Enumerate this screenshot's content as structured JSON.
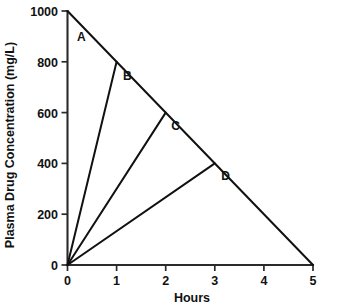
{
  "chart_data": {
    "type": "line",
    "title": "",
    "xlabel": "Hours",
    "ylabel": "Plasma Drug Concentration (mg/L)",
    "xlim": [
      0,
      5
    ],
    "ylim": [
      0,
      1000
    ],
    "x_ticks": [
      "0",
      "1",
      "2",
      "3",
      "4",
      "5"
    ],
    "x_tick_values": [
      0,
      1,
      2,
      3,
      4,
      5
    ],
    "y_ticks": [
      "0",
      "200",
      "400",
      "600",
      "800",
      "1000"
    ],
    "y_tick_values": [
      0,
      200,
      400,
      600,
      800,
      1000
    ],
    "grid": false,
    "legend": "none",
    "line_color": "#111111",
    "axis_color": "#2a2a2a",
    "series": [
      {
        "name": "elimination-line",
        "points": [
          [
            0,
            1000
          ],
          [
            5,
            0
          ]
        ]
      },
      {
        "name": "absorption-line-b",
        "points": [
          [
            0,
            0
          ],
          [
            1,
            800
          ]
        ]
      },
      {
        "name": "absorption-line-c",
        "points": [
          [
            0,
            0
          ],
          [
            2,
            600
          ]
        ]
      },
      {
        "name": "absorption-line-d",
        "points": [
          [
            0,
            0
          ],
          [
            3,
            400
          ]
        ]
      }
    ],
    "annotations": [
      {
        "text": "A",
        "x": 0.28,
        "y": 880
      },
      {
        "text": "B",
        "x": 1.22,
        "y": 728
      },
      {
        "text": "C",
        "x": 2.2,
        "y": 533
      },
      {
        "text": "D",
        "x": 3.22,
        "y": 333
      }
    ]
  },
  "labels": {
    "y_axis_title": "Plasma Drug Concentration (mg/L)",
    "x_axis_title": "Hours",
    "series_a": "A",
    "series_b": "B",
    "series_c": "C",
    "series_d": "D",
    "y_1000": "1000",
    "y_800": "800",
    "y_600": "600",
    "y_400": "400",
    "y_200": "200",
    "y_0": "0",
    "x_0": "0",
    "x_1": "1",
    "x_2": "2",
    "x_3": "3",
    "x_4": "4",
    "x_5": "5"
  }
}
